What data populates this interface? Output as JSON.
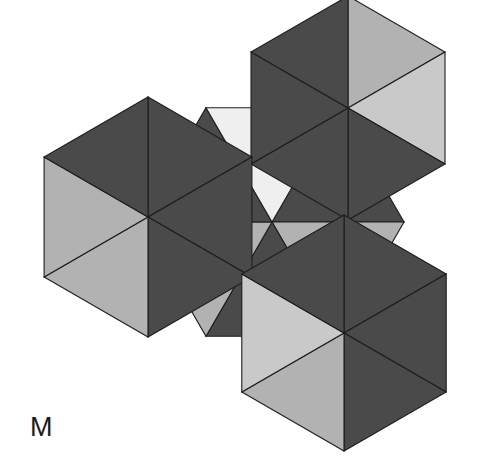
{
  "figure": {
    "panel_label": "M",
    "background_color": "#ffffff",
    "outline_color": "#1d1d1d",
    "palette": {
      "dark_gray": "#4a4a4a",
      "mid_gray": "#6f6f6f",
      "light_gray": "#b2b2b2",
      "pale_gray": "#c9c9c9",
      "near_white": "#efefef",
      "white": "#ffffff"
    },
    "canvas": {
      "width": 484,
      "height": 458
    }
  },
  "chart_data": {
    "type": "diagram",
    "title": "M",
    "tiles": [
      {
        "name": "center-hexagon",
        "center": [
          272,
          222
        ],
        "radius": 132,
        "rotation_deg": 30,
        "segments": [
          {
            "index": 0,
            "shade": "dark_gray",
            "hex": "#4a4a4a"
          },
          {
            "index": 1,
            "shade": "light_gray",
            "hex": "#b2b2b2"
          },
          {
            "index": 2,
            "shade": "dark_gray",
            "hex": "#4a4a4a"
          },
          {
            "index": 3,
            "shade": "light_gray",
            "hex": "#b2b2b2"
          },
          {
            "index": 4,
            "shade": "dark_gray",
            "hex": "#4a4a4a"
          },
          {
            "index": 5,
            "shade": "near_white",
            "hex": "#efefef"
          }
        ]
      },
      {
        "name": "top-right-hexagon",
        "center": [
          348,
          108
        ],
        "radius": 112,
        "rotation_deg": 0,
        "segments": [
          {
            "index": 0,
            "shade": "light_gray",
            "hex": "#b2b2b2"
          },
          {
            "index": 1,
            "shade": "pale_gray",
            "hex": "#c9c9c9"
          },
          {
            "index": 2,
            "shade": "dark_gray",
            "hex": "#4a4a4a"
          },
          {
            "index": 3,
            "shade": "dark_gray",
            "hex": "#4a4a4a"
          },
          {
            "index": 4,
            "shade": "dark_gray",
            "hex": "#4a4a4a"
          },
          {
            "index": 5,
            "shade": "dark_gray",
            "hex": "#4a4a4a"
          }
        ]
      },
      {
        "name": "left-hexagon",
        "center": [
          148,
          217
        ],
        "radius": 120,
        "rotation_deg": 0,
        "segments": [
          {
            "index": 0,
            "shade": "dark_gray",
            "hex": "#4a4a4a"
          },
          {
            "index": 1,
            "shade": "dark_gray",
            "hex": "#4a4a4a"
          },
          {
            "index": 2,
            "shade": "dark_gray",
            "hex": "#4a4a4a"
          },
          {
            "index": 3,
            "shade": "light_gray",
            "hex": "#b2b2b2"
          },
          {
            "index": 4,
            "shade": "light_gray",
            "hex": "#b2b2b2"
          },
          {
            "index": 5,
            "shade": "dark_gray",
            "hex": "#4a4a4a"
          }
        ]
      },
      {
        "name": "bottom-hexagon",
        "center": [
          344,
          333
        ],
        "radius": 118,
        "rotation_deg": 0,
        "segments": [
          {
            "index": 0,
            "shade": "dark_gray",
            "hex": "#4a4a4a"
          },
          {
            "index": 1,
            "shade": "dark_gray",
            "hex": "#4a4a4a"
          },
          {
            "index": 2,
            "shade": "dark_gray",
            "hex": "#4a4a4a"
          },
          {
            "index": 3,
            "shade": "light_gray",
            "hex": "#b2b2b2"
          },
          {
            "index": 4,
            "shade": "pale_gray",
            "hex": "#c9c9c9"
          },
          {
            "index": 5,
            "shade": "dark_gray",
            "hex": "#4a4a4a"
          }
        ]
      }
    ]
  },
  "paths": {
    "center": [
      {
        "name": "center-seg-upper-left",
        "d": "M 272,222 L 162,123 L 272,15 L 272,222 Z",
        "fill": "#4a4a4a"
      },
      {
        "name": "center-seg-upper-left-b",
        "d": "M 272,222 L 162,123 L 162,240 Z",
        "fill": "#4a4a4a"
      },
      {
        "name": "center-seg-left-white",
        "d": "M 272,222 L 162,240 L 162,123 L 199,123 Z",
        "fill": "#efefef"
      },
      {
        "name": "center-seg-lower-left",
        "d": "M 272,222 L 162,240 L 207,325 L 272,325 Z",
        "fill": "#4a4a4a"
      },
      {
        "name": "center-seg-bottom",
        "d": "M 272,222 L 272,325 L 337,325 Z",
        "fill": "#b2b2b2"
      },
      {
        "name": "center-seg-right",
        "d": "M 272,222 L 337,325 L 382,240 Z",
        "fill": "#4a4a4a"
      },
      {
        "name": "center-seg-upper-right",
        "d": "M 272,222 L 382,240 L 382,123 Z",
        "fill": "#b2b2b2"
      },
      {
        "name": "center-seg-top-right",
        "d": "M 272,222 L 382,123 L 272,15 Z",
        "fill": "#4a4a4a"
      }
    ]
  }
}
